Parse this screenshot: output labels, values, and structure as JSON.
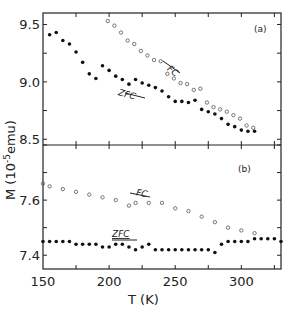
{
  "chart_data": [
    {
      "panel": "(a)",
      "type": "scatter",
      "xlabel": "T (K)",
      "ylabel": "M (10^-5 emu)",
      "xlim": [
        150,
        330
      ],
      "ylim": [
        8.45,
        9.6
      ],
      "yticks": [
        8.5,
        9.0,
        9.5
      ],
      "ytick_labels": [
        "8.5",
        "9.0",
        "9.5"
      ],
      "grid": false,
      "series": [
        {
          "name": "FC",
          "marker": "open-circle",
          "x": [
            194,
            199,
            204,
            209,
            214,
            219,
            224,
            229,
            234,
            239,
            244,
            249,
            254,
            259,
            264,
            269,
            274,
            279,
            284,
            289,
            294,
            299,
            304,
            309
          ],
          "y": [
            9.61,
            9.53,
            9.49,
            9.43,
            9.36,
            9.33,
            9.27,
            9.23,
            9.19,
            9.18,
            9.07,
            9.03,
            8.99,
            8.98,
            8.93,
            8.94,
            8.82,
            8.78,
            8.76,
            8.74,
            8.71,
            8.68,
            8.62,
            8.6
          ]
        },
        {
          "name": "ZFC",
          "marker": "filled-circle",
          "x": [
            155,
            160,
            165,
            170,
            175,
            180,
            185,
            190,
            195,
            200,
            205,
            210,
            215,
            220,
            225,
            230,
            235,
            240,
            245,
            250,
            255,
            260,
            265,
            270,
            275,
            280,
            285,
            290,
            295,
            300,
            305,
            310
          ],
          "y": [
            9.41,
            9.43,
            9.36,
            9.33,
            9.26,
            9.17,
            9.07,
            9.03,
            9.14,
            9.1,
            9.05,
            9.02,
            8.98,
            9.02,
            8.99,
            8.97,
            8.95,
            8.92,
            8.87,
            8.83,
            8.83,
            8.82,
            8.84,
            8.76,
            8.74,
            8.72,
            8.68,
            8.63,
            8.61,
            8.58,
            8.57,
            8.57
          ]
        }
      ],
      "annotations": [
        "(a)",
        "FC",
        "ZFC"
      ]
    },
    {
      "panel": "(b)",
      "type": "scatter",
      "xlabel": "T (K)",
      "ylabel": "M (10^-5 emu)",
      "xlim": [
        150,
        330
      ],
      "ylim": [
        7.35,
        7.8
      ],
      "xticks": [
        150,
        200,
        250,
        300
      ],
      "xtick_labels": [
        "150",
        "200",
        "250",
        "300"
      ],
      "yticks": [
        7.4,
        7.6
      ],
      "ytick_labels": [
        "7.4",
        "7.6"
      ],
      "grid": false,
      "series": [
        {
          "name": "FC",
          "marker": "open-circle",
          "x": [
            150,
            155,
            165,
            175,
            185,
            195,
            205,
            215,
            220,
            230,
            240,
            250,
            260,
            270,
            280,
            290,
            300,
            310
          ],
          "y": [
            7.66,
            7.65,
            7.64,
            7.63,
            7.62,
            7.61,
            7.6,
            7.58,
            7.59,
            7.59,
            7.59,
            7.57,
            7.56,
            7.54,
            7.52,
            7.5,
            7.49,
            7.48
          ]
        },
        {
          "name": "ZFC",
          "marker": "filled-circle",
          "x": [
            150,
            155,
            160,
            165,
            170,
            175,
            180,
            185,
            190,
            195,
            200,
            205,
            210,
            215,
            220,
            225,
            230,
            235,
            240,
            245,
            250,
            255,
            260,
            265,
            270,
            275,
            280,
            285,
            290,
            295,
            300,
            305,
            310,
            315,
            320,
            325,
            330
          ],
          "y": [
            7.45,
            7.45,
            7.45,
            7.45,
            7.45,
            7.44,
            7.44,
            7.44,
            7.44,
            7.43,
            7.43,
            7.44,
            7.44,
            7.43,
            7.42,
            7.43,
            7.44,
            7.42,
            7.42,
            7.42,
            7.42,
            7.42,
            7.42,
            7.42,
            7.42,
            7.42,
            7.41,
            7.44,
            7.45,
            7.45,
            7.45,
            7.45,
            7.46,
            7.46,
            7.46,
            7.46,
            7.45
          ]
        }
      ],
      "annotations": [
        "(b)",
        "FC",
        "ZFC"
      ]
    }
  ],
  "labels": {
    "ylabel_main": "M (10",
    "ylabel_exp": "-5",
    "ylabel_unit": "emu)",
    "xlabel": "T (K)",
    "panel_a": "(a)",
    "panel_b": "(b)",
    "fc": "FC",
    "zfc": "ZFC"
  }
}
